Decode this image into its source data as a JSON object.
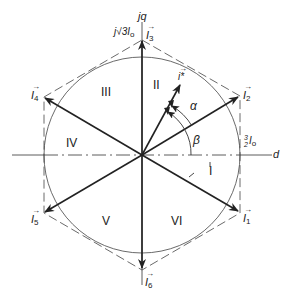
{
  "diagram": {
    "type": "space-vector hexagon diagram",
    "axes": {
      "horizontal": "d",
      "vertical": "jq"
    },
    "magnitudes": {
      "top_label_prefix": "j√3",
      "top_label_base": "I",
      "top_label_sub": "o",
      "side_label_num": "3",
      "side_label_den": "2",
      "side_label_base": "I",
      "side_label_sub": "o"
    },
    "vectors": [
      {
        "id": "I1",
        "base": "I",
        "sub": "1"
      },
      {
        "id": "I2",
        "base": "I",
        "sub": "2"
      },
      {
        "id": "I3",
        "base": "I",
        "sub": "3"
      },
      {
        "id": "I4",
        "base": "I",
        "sub": "4"
      },
      {
        "id": "I5",
        "base": "I",
        "sub": "5"
      },
      {
        "id": "I6",
        "base": "I",
        "sub": "6"
      },
      {
        "id": "i_star",
        "base": "i*"
      }
    ],
    "sectors": [
      "I",
      "II",
      "III",
      "IV",
      "V",
      "VI"
    ],
    "angles": {
      "alpha": "α",
      "beta": "β"
    },
    "colors": {
      "line": "#222222",
      "background": "#ffffff"
    }
  }
}
